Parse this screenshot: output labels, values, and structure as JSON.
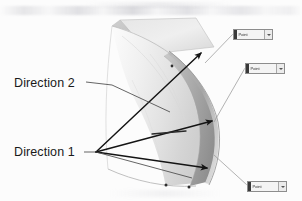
{
  "diagram": {
    "background_color": "#fcfcfc",
    "annotations": {
      "direction_2": "Direction 2",
      "direction_1": "Direction 1"
    },
    "callouts": [
      {
        "id": "callout-1",
        "label": "Point",
        "x": 233,
        "y": 29
      },
      {
        "id": "callout-2",
        "label": "Point",
        "x": 245,
        "y": 63
      },
      {
        "id": "callout-3",
        "label": "Point",
        "x": 247,
        "y": 181
      }
    ],
    "colors": {
      "surface_light": "#e9e9e9",
      "surface_mid": "#d2d2d2",
      "surface_shadow": "#a9a9a9",
      "surface_dark_band": "#9a9a9a",
      "outline": "#9b9b9b",
      "arrow": "#1b1b1b",
      "leader": "#8a8a8a",
      "text": "#1a1a1a"
    },
    "geometry": {
      "note": "Curved lofted shell viewed in 3D; arrows indicate sweep directions",
      "direction_1_arrows": 3,
      "direction_2_arrows": 1,
      "vertex_direction_1": [
        96,
        152
      ],
      "vertex_direction_2_tip": [
        201,
        53
      ]
    }
  }
}
